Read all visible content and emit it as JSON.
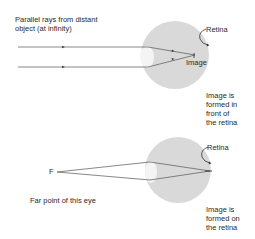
{
  "top_diagram": {
    "caption": "Parallel rays from distant\nobject (at infinity)",
    "retina_label": "Retina",
    "image_label": "Image",
    "note": "Image is\nformed in\nfront of\nthe retina"
  },
  "bottom_diagram": {
    "far_point_marker": "F",
    "far_point_caption": "Far point of this eye",
    "retina_label": "Retina",
    "note": "Image is\nformed on\nthe retina"
  },
  "colors": {
    "eyeball": "#d9d9d9",
    "lens": "#f4f4f4",
    "rays": "#555555"
  }
}
